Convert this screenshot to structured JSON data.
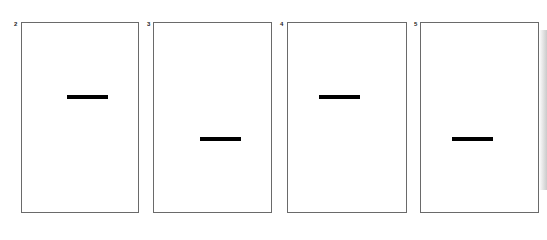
{
  "panels": [
    {
      "label": "2",
      "box": {
        "left": 21,
        "top": 22,
        "width": 118,
        "height": 191
      },
      "bar": {
        "left": 67,
        "top": 95
      },
      "num": {
        "left": 14,
        "top": 21
      }
    },
    {
      "label": "3",
      "box": {
        "left": 153,
        "top": 22,
        "width": 119,
        "height": 191
      },
      "bar": {
        "left": 200,
        "top": 137
      },
      "num": {
        "left": 147,
        "top": 21
      }
    },
    {
      "label": "4",
      "box": {
        "left": 287,
        "top": 22,
        "width": 120,
        "height": 191
      },
      "bar": {
        "left": 319,
        "top": 95
      },
      "num": {
        "left": 280,
        "top": 21
      }
    },
    {
      "label": "5",
      "box": {
        "left": 420,
        "top": 22,
        "width": 119,
        "height": 191
      },
      "bar": {
        "left": 452,
        "top": 137
      },
      "num": {
        "left": 414,
        "top": 21
      }
    }
  ]
}
